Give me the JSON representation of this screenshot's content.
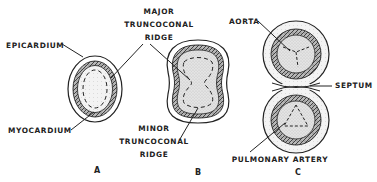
{
  "figure": {
    "panels": [
      {
        "id": "A",
        "label": "A",
        "annotations": {
          "epicardium": "EPICARDIUM",
          "myocardium": "MYOCARDIUM"
        }
      },
      {
        "id": "B",
        "label": "B",
        "annotations": {
          "major_ridge": [
            "MAJOR",
            "TRUNCOCONAL",
            "RIDGE"
          ],
          "minor_ridge": [
            "MINOR",
            "TRUNCOCONAL",
            "RIDGE"
          ]
        }
      },
      {
        "id": "C",
        "label": "C",
        "annotations": {
          "aorta": "AORTA",
          "septum": "SEPTUM",
          "pulmonary_artery": "PULMONARY ARTERY"
        }
      }
    ]
  },
  "colors": {
    "ink": "#222222",
    "outer_wall": "#ededed",
    "myocardium_band": "#9a9a9a",
    "lumen": "#dcdcdc"
  }
}
